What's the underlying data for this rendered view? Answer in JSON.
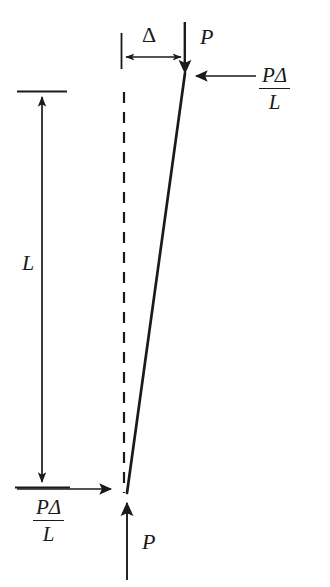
{
  "figure": {
    "type": "engineering-free-body-diagram",
    "background_color": "#ffffff",
    "ink_color": "#1a1a1a"
  },
  "labels": {
    "length": "L",
    "deflection": "Δ",
    "axial_load_top": "P",
    "axial_load_bottom": "P",
    "shear_right_numerator": "PΔ",
    "shear_right_denominator": "L",
    "shear_left_numerator": "PΔ",
    "shear_left_denominator": "L"
  },
  "elements": {
    "column": {
      "name": "deflected-column-line",
      "top_point": [
        185,
        72
      ],
      "bottom_point": [
        127,
        492
      ],
      "style": "solid",
      "stroke_width": 2.6
    },
    "reference_axis": {
      "name": "undeflected-axis-dashed-line",
      "top_point": [
        124,
        90
      ],
      "bottom_point": [
        124,
        492
      ],
      "style": "dashed",
      "dash_pattern": "11 9",
      "stroke_width": 2.2
    },
    "length_dimension": {
      "name": "length-dimension-arrow",
      "x": 42,
      "top_y": 92,
      "bottom_y": 487,
      "arrowheads": "both",
      "tick_half_width": 25
    },
    "deflection_dimension": {
      "name": "deflection-dimension-arrow",
      "y": 57,
      "left_x": 122,
      "right_x": 185,
      "arrowheads": "both",
      "extension_top_y": 32,
      "extension_bottom_y": 68
    },
    "top_axial_arrow": {
      "name": "top-axial-load-arrow",
      "x": 185,
      "from_y": 22,
      "to_y": 74,
      "direction": "down"
    },
    "bottom_axial_arrow": {
      "name": "bottom-axial-load-arrow",
      "x": 127,
      "from_y": 580,
      "to_y": 500,
      "direction": "up"
    },
    "top_shear_arrow": {
      "name": "top-shear-force-arrow",
      "y": 76,
      "from_x": 256,
      "to_x": 193,
      "direction": "left"
    },
    "bottom_shear_arrow": {
      "name": "bottom-shear-force-arrow",
      "y": 489,
      "from_x": 17,
      "to_x": 114,
      "direction": "right"
    }
  }
}
